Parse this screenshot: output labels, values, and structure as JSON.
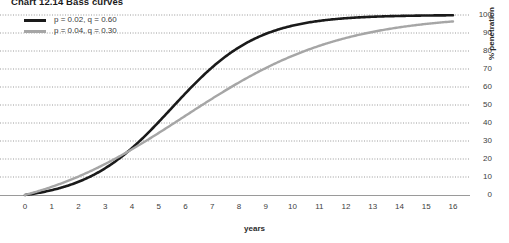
{
  "title": {
    "full": "Chart 12.14  Bass curves",
    "number": "Chart 12.14",
    "name": "Bass curves"
  },
  "legend": {
    "position": "top-left",
    "entries": [
      {
        "label": "p = 0.02, q = 0.60",
        "color": "#1a1a1a",
        "name": "series-black"
      },
      {
        "label": "p = 0.04, q = 0.30",
        "color": "#a6a6a6",
        "name": "series-gray"
      }
    ]
  },
  "axes": {
    "x": {
      "title": "years",
      "min": 0,
      "max": 16,
      "ticks": [
        "0",
        "1",
        "2",
        "3",
        "4",
        "5",
        "6",
        "7",
        "8",
        "9",
        "10",
        "11",
        "12",
        "13",
        "14",
        "15",
        "16"
      ]
    },
    "y": {
      "title": "% penetration",
      "min": 0,
      "max": 100,
      "side": "right",
      "ticks": [
        "0",
        "10",
        "20",
        "30",
        "40",
        "50",
        "60",
        "70",
        "80",
        "90",
        "100"
      ]
    }
  },
  "style": {
    "gridline_color": "#808080",
    "gridline_style": "dotted",
    "axis_color": "#808080",
    "background": "#ffffff"
  },
  "chart_data": {
    "type": "line",
    "title": "Chart 12.14  Bass curves",
    "xlabel": "years",
    "ylabel": "% penetration",
    "xlim": [
      0,
      16
    ],
    "ylim": [
      0,
      100
    ],
    "grid": true,
    "legend_position": "top-left",
    "x": [
      0,
      1,
      2,
      3,
      4,
      5,
      6,
      7,
      8,
      9,
      10,
      11,
      12,
      13,
      14,
      15,
      16
    ],
    "series": [
      {
        "name": "p = 0.02, q = 0.60",
        "color": "#1a1a1a",
        "p": 0.02,
        "q": 0.6,
        "values": [
          0.0,
          2.0,
          4.6,
          8.0,
          13.5,
          21.5,
          32.6,
          46.3,
          60.6,
          73.1,
          82.7,
          89.2,
          93.4,
          96.0,
          97.6,
          98.6,
          99.2
        ]
      },
      {
        "name": "p = 0.04, q = 0.30",
        "color": "#a6a6a6",
        "p": 0.04,
        "q": 0.3,
        "values": [
          0.0,
          4.0,
          8.6,
          13.8,
          19.6,
          26.0,
          32.8,
          40.0,
          47.3,
          54.5,
          61.3,
          67.6,
          73.2,
          78.1,
          82.2,
          85.7,
          88.6
        ]
      }
    ]
  }
}
